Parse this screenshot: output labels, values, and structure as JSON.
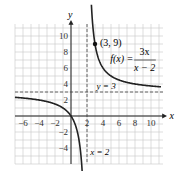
{
  "chart_data": {
    "type": "line",
    "title": "",
    "function_label": "f(x) = 3x/(x-2)",
    "function_num": "3x",
    "function_den": "x − 2",
    "function_prefix": "f(x) =",
    "xlabel": "x",
    "ylabel": "y",
    "xlim": [
      -7,
      11.5
    ],
    "ylim": [
      -6,
      11.5
    ],
    "x_ticks": [
      -6,
      -4,
      -2,
      2,
      4,
      6,
      8,
      10
    ],
    "y_ticks": [
      -4,
      -2,
      2,
      4,
      6,
      8,
      10
    ],
    "x_tick_labels": [
      "−6",
      "−4",
      "−2",
      "2",
      "4",
      "6",
      "8",
      "10"
    ],
    "y_tick_labels": [
      "−4",
      "−2",
      "2",
      "4",
      "6",
      "8",
      "10"
    ],
    "grid": true,
    "asymptotes": [
      {
        "type": "vertical",
        "value": 2,
        "label": "x = 2"
      },
      {
        "type": "horizontal",
        "value": 3,
        "label": "y = 3"
      }
    ],
    "points": [
      {
        "x": 3,
        "y": 9,
        "label": "(3, 9)"
      }
    ],
    "series": [
      {
        "name": "f(x)=3x/(x-2)",
        "branch": "right",
        "x": [
          2.6,
          3,
          4,
          6,
          8,
          10,
          11.5
        ],
        "y": [
          13,
          9,
          6,
          4.5,
          4,
          3.75,
          3.63
        ]
      },
      {
        "name": "f(x)=3x/(x-2)",
        "branch": "left",
        "x": [
          -7,
          -6,
          -4,
          -2,
          0,
          1,
          1.5
        ],
        "y": [
          2.33,
          2.25,
          2,
          1.5,
          0,
          -3,
          -9
        ]
      }
    ]
  }
}
